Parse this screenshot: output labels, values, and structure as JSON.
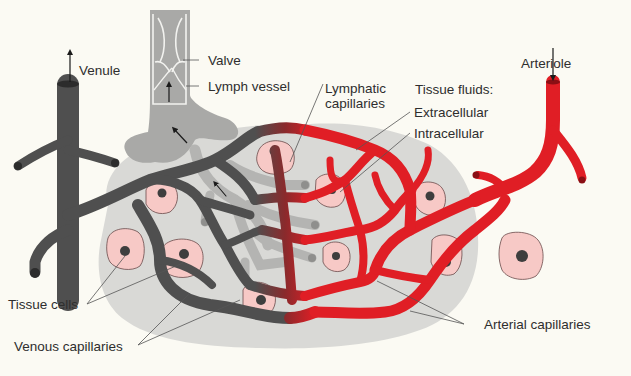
{
  "diagram": {
    "kind": "anatomical illustration",
    "colors": {
      "background": "#fbfaf3",
      "tissue_fluid": "#d9d9d6",
      "venous": "#4f4f4f",
      "arterial": "#e01e25",
      "lymph": "#a9a9a7",
      "lymph_light": "#c4c4c2",
      "tissue_cell": "#f7c9c6",
      "nucleus": "#3e3e3e",
      "label_text": "#2e2e2e",
      "leader_line": "#555555"
    },
    "labels": {
      "venule": "Venule",
      "valve": "Valve",
      "lymph_vessel": "Lymph vessel",
      "lymphatic_capillaries": "Lymphatic\ncapillaries",
      "tissue_fluids": "Tissue fluids:",
      "extracellular": "Extracellular",
      "intracellular": "Intracellular",
      "arteriole": "Arteriole",
      "tissue_cells": "Tissue cells",
      "venous_capillaries": "Venous capillaries",
      "arterial_capillaries": "Arterial capillaries"
    },
    "flow_arrows": [
      {
        "at": "venule",
        "direction": "up"
      },
      {
        "at": "arteriole",
        "direction": "down"
      },
      {
        "at": "lymph vessel",
        "direction": "up"
      },
      {
        "at": "lymph trunk",
        "direction": "up-left"
      },
      {
        "at": "lymphatic capillaries",
        "direction": "up-left"
      }
    ]
  }
}
